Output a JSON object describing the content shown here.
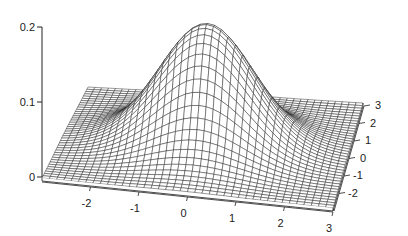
{
  "chart_data": {
    "type": "surface3d",
    "title": "",
    "function": "gaussian2d",
    "sigma": 1.0,
    "x_range": [
      -3,
      3
    ],
    "y_range": [
      -3,
      3
    ],
    "z_range": [
      0,
      0.2
    ],
    "grid_steps": 40,
    "peak_value": 0.159,
    "x_ticks": [
      -2,
      -1,
      0,
      1,
      2,
      3
    ],
    "y_ticks": [
      -2,
      -1,
      0,
      1,
      2,
      3
    ],
    "z_ticks": [
      0,
      0.1,
      0.2
    ],
    "z_tick_labels": [
      "0",
      "0.1",
      "0.2"
    ],
    "xlabel": "",
    "ylabel": "",
    "zlabel": "",
    "grid": false,
    "legend": null,
    "colors": {
      "mesh_line": "#1a1a1a",
      "mesh_face": "#ffffff",
      "axis": "#222222",
      "background": "#ffffff"
    }
  }
}
